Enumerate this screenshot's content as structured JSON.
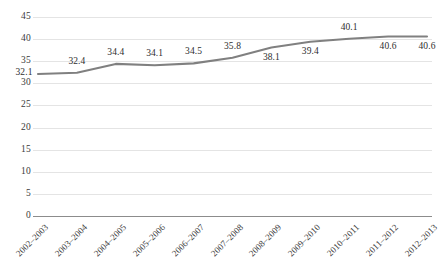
{
  "chart_data": {
    "type": "line",
    "title": "",
    "subtitle": "",
    "xlabel": "",
    "ylabel": "",
    "categories": [
      "2002–2003",
      "2003–2004",
      "2004–2005",
      "2005–2006",
      "2006–2007",
      "2007–2008",
      "2008–2009",
      "2009–2010",
      "2010–2011",
      "2011–2012",
      "2012–2013"
    ],
    "values": [
      32.1,
      32.4,
      34.4,
      34.1,
      34.5,
      35.8,
      38.1,
      39.4,
      40.1,
      40.6,
      40.6
    ],
    "data_labels": [
      "32.1",
      "32.4",
      "34.4",
      "34.1",
      "34.5",
      "35.8",
      "38.1",
      "39.4",
      "40.1",
      "40.6",
      "40.6"
    ],
    "label_positions": [
      "left",
      "above",
      "above",
      "above",
      "above",
      "above",
      "below",
      "below",
      "above",
      "below",
      "below"
    ],
    "ylim": [
      0,
      45
    ],
    "ytick_values": [
      45,
      40,
      35,
      30,
      25,
      20,
      15,
      10,
      5,
      0
    ],
    "ytick_labels": [
      "45",
      "40",
      "35",
      "30",
      "25",
      "20",
      "15",
      "10",
      "5",
      "0"
    ],
    "grid": true,
    "legend": false,
    "legend_position": "none",
    "series_color": "#808080",
    "gridline_color": "#e4e4e4",
    "axis_color": "#8c8c8c",
    "background_color": "#ffffff",
    "label_text_color": "#2e2e2e"
  }
}
